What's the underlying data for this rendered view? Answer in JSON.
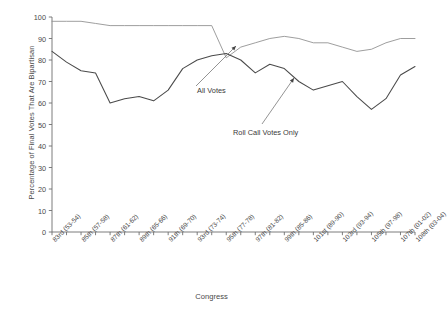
{
  "chart_data": {
    "type": "line",
    "title": "",
    "xlabel": "Congress",
    "ylabel": "Percentage of Final Votes That Are Bipartisan",
    "ylim": [
      0,
      100
    ],
    "yticks": [
      0,
      10,
      20,
      30,
      40,
      50,
      60,
      70,
      80,
      90,
      100
    ],
    "grid": false,
    "legend_position": "inline-annotations",
    "categories": [
      "83rd (53-54)",
      "84th (55-56)",
      "85th (57-58)",
      "86th (59-60)",
      "87th (61-62)",
      "88th (63-64)",
      "89th (65-66)",
      "90th (67-68)",
      "91th (69-70)",
      "92nd (71-72)",
      "93rd (73-74)",
      "94th (75-76)",
      "95th (77-78)",
      "96th (79-80)",
      "97th (81-82)",
      "98th (83-84)",
      "99th (85-86)",
      "100th (87-88)",
      "101st (89-90)",
      "102nd (91-92)",
      "103rd (93-94)",
      "104th (95-96)",
      "105th (97-98)",
      "106th (99-00)",
      "107th (01-02)",
      "108th (03-04)"
    ],
    "tick_labels_shown": [
      "83rd (53-54)",
      "85th (57-58)",
      "87th (61-62)",
      "89th (65-66)",
      "91th (69-70)",
      "93rd (73-74)",
      "95th (77-78)",
      "97th (81-82)",
      "99th (85-86)",
      "101st (89-90)",
      "103rd (93-94)",
      "105th (97-98)",
      "107th (01-02)",
      "108th (03-04)"
    ],
    "series": [
      {
        "name": "All Votes",
        "color": "#8c8c8c",
        "values": [
          98,
          98,
          98,
          97,
          96,
          96,
          96,
          96,
          96,
          96,
          96,
          96,
          81,
          86,
          88,
          90,
          91,
          90,
          88,
          88,
          86,
          84,
          85,
          88,
          90,
          90
        ]
      },
      {
        "name": "Roll Call Votes Only",
        "color": "#4a4a4a",
        "values": [
          84,
          79,
          75,
          74,
          60,
          62,
          63,
          61,
          66,
          76,
          80,
          82,
          83,
          80,
          74,
          78,
          76,
          70,
          66,
          68,
          70,
          63,
          57,
          62,
          73,
          77
        ]
      }
    ],
    "annotations": [
      {
        "text": "All Votes",
        "x": 0.45,
        "y": 0.3
      },
      {
        "text": "Roll Call Votes Only",
        "x": 0.55,
        "y": 0.42
      }
    ]
  },
  "axis": {
    "y_title": "Percentage of Final Votes That Are Bipartisan",
    "x_title": "Congress"
  },
  "annotations": {
    "all_votes": "All Votes",
    "roll_call": "Roll Call Votes Only"
  }
}
